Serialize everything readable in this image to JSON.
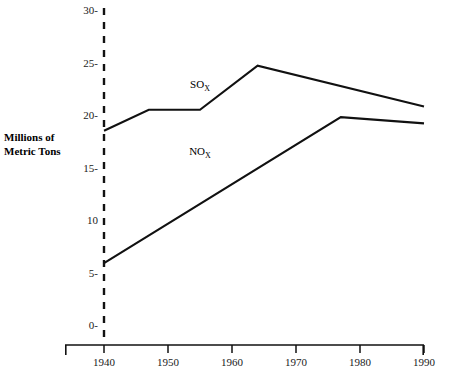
{
  "chart_data": {
    "type": "line",
    "title": "",
    "xlabel": "",
    "ylabel": "Millions of Metric Tons",
    "ylabel_line1": "Millions of",
    "ylabel_line2": "Metric Tons",
    "xlim": [
      1936,
      1994
    ],
    "ylim": [
      0,
      30
    ],
    "x_ticks": [
      1940,
      1950,
      1960,
      1970,
      1980,
      1990
    ],
    "x_tick_labels": [
      "1940",
      "1950",
      "1960",
      "1970",
      "1980",
      "1990"
    ],
    "y_ticks": [
      0,
      5,
      10,
      15,
      20,
      25,
      30
    ],
    "y_tick_labels": [
      "0-",
      "5-",
      "10",
      "15-",
      "20-",
      "25-",
      "30-"
    ],
    "grid": false,
    "legend": "inline-annotations",
    "reference_line": {
      "x": 1940,
      "style": "dashed",
      "label": "1940"
    },
    "series": [
      {
        "name": "SOx",
        "label_text": "SO",
        "label_sub": "X",
        "label_x": 1955,
        "label_y": 22.6,
        "x": [
          1940,
          1947,
          1955,
          1964,
          1990
        ],
        "values": [
          18.5,
          20.5,
          20.5,
          24.7,
          20.8
        ]
      },
      {
        "name": "NOx",
        "label_text": "NO",
        "label_sub": "X",
        "label_x": 1955,
        "label_y": 16.2,
        "x": [
          1940,
          1977,
          1990
        ],
        "values": [
          5.9,
          19.8,
          19.2
        ]
      }
    ]
  },
  "colors": {
    "line": "#111111",
    "axis": "#111111",
    "text": "#000000",
    "background": "#ffffff"
  }
}
